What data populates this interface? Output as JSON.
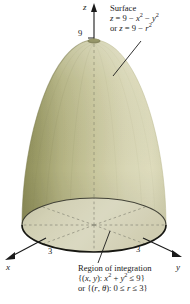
{
  "figure": {
    "background_color": "#ffffff",
    "type": "3d-paraboloid-solid-of-integration"
  },
  "axes": {
    "z": {
      "letter": "z",
      "tick_label": "9"
    },
    "x": {
      "letter": "x",
      "tick_label": "3"
    },
    "y": {
      "letter": "y",
      "tick_label": "3"
    }
  },
  "surface_callout": {
    "title": "Surface",
    "equation_1_parts": {
      "z": "z",
      "eq": " = 9 − ",
      "x": "x",
      "exp1": "2",
      "minus": " − ",
      "y": "y",
      "exp2": "2"
    },
    "equation_2_parts": {
      "or": "or ",
      "z": "z",
      "eq": " = 9 − ",
      "r": "r",
      "exp": "2"
    }
  },
  "region_callout": {
    "title": "Region of integration",
    "set_parts": {
      "open": "{(",
      "x": "x",
      "comma": ", ",
      "y": "y",
      "close_paren": "): ",
      "x2": "x",
      "exp1": "2",
      "plus": " + ",
      "y2": "y",
      "exp2": "2",
      "le9": " ≤ 9}"
    },
    "polar_parts": {
      "or": "or {(",
      "r": "r",
      "comma": ", ",
      "theta": "θ",
      "close_paren": "): 0 ≤ ",
      "r2": "r",
      "le3": " ≤ 3}"
    }
  },
  "colors": {
    "surface_dark_olive": "#8f8f5c",
    "surface_mid_olive": "#b4b481",
    "surface_light_cream": "#dcdcba",
    "base_fill": "#d3d1b6",
    "outline": "#1a1a1a",
    "dashed_line": "#8a8a78"
  },
  "geometry": {
    "apex": {
      "x": 94,
      "y": 40
    },
    "base_center": {
      "x": 94,
      "y": 225
    },
    "base_rx": 72,
    "base_ry": 27,
    "z_axis_top": {
      "x": 94,
      "y": 5
    },
    "x_axis_end": {
      "x": 5,
      "y": 258
    },
    "y_axis_end": {
      "x": 181,
      "y": 256
    }
  }
}
